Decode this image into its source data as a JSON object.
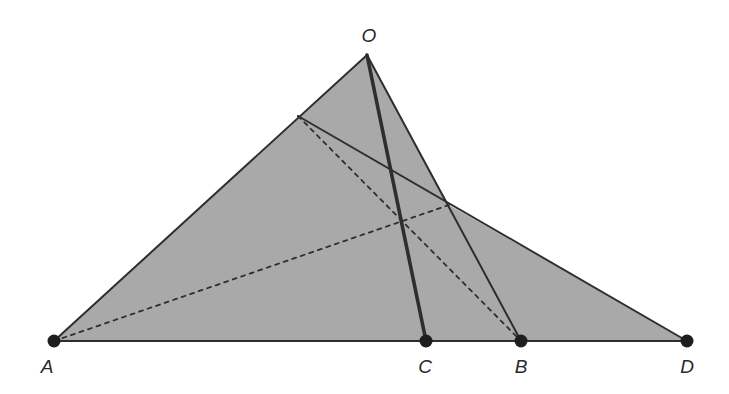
{
  "diagram": {
    "type": "geometry-figure",
    "fill_color": "#a9a9a9",
    "stroke_color": "#2e2e2e",
    "points": {
      "O": {
        "label": "O",
        "x": 367,
        "y": 55,
        "label_x": 369,
        "label_y": 35
      },
      "A": {
        "label": "A",
        "x": 54,
        "y": 341,
        "label_x": 47,
        "label_y": 366
      },
      "C": {
        "label": "C",
        "x": 426,
        "y": 341,
        "label_x": 425,
        "label_y": 366
      },
      "B": {
        "label": "B",
        "x": 521,
        "y": 341,
        "label_x": 521,
        "label_y": 366
      },
      "D": {
        "label": "D",
        "x": 687,
        "y": 341,
        "label_x": 687,
        "label_y": 366
      },
      "E": {
        "x": 298,
        "y": 116
      },
      "P": {
        "x": 449,
        "y": 205
      }
    },
    "shaded_region": [
      "A",
      "O",
      "P",
      "D"
    ],
    "solid_segments": [
      [
        "A",
        "O"
      ],
      [
        "O",
        "B"
      ],
      [
        "A",
        "D"
      ],
      [
        "E",
        "D"
      ]
    ],
    "thick_segments": [
      [
        "O",
        "C"
      ]
    ],
    "dashed_segments": [
      [
        "A",
        "P"
      ],
      [
        "E",
        "B"
      ]
    ],
    "marked_points": [
      "A",
      "C",
      "B",
      "D"
    ]
  }
}
